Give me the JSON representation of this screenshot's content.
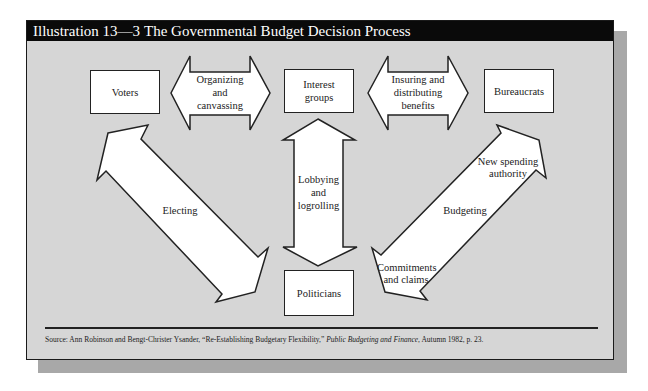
{
  "header": {
    "number": "Illustration 13—3",
    "title": "The Governmental Budget Decision Process"
  },
  "nodes": {
    "voters": "Voters",
    "interest_groups": "Interest groups",
    "bureaucrats": "Bureaucrats",
    "politicians": "Politicians"
  },
  "arrows": {
    "organizing": [
      "Organizing",
      "and",
      "canvassing"
    ],
    "insuring": [
      "Insuring and",
      "distributing",
      "benefits"
    ],
    "lobbying": [
      "Lobbying",
      "and",
      "logrolling"
    ],
    "electing": "Electing",
    "budgeting": "Budgeting",
    "new_spending": [
      "New spending",
      "authority"
    ],
    "commitments": [
      "Commitments",
      "and claims"
    ]
  },
  "source": {
    "prefix": "Source: Ann Robinson and Bengt-Christer Ysander, “Re-Establishing Budgetary Flexibility,” ",
    "journal": "Public Budgeting and Finance",
    "suffix": ", Autumn 1982, p. 23."
  },
  "colors": {
    "panel": "#d6d6d6",
    "header": "#0a0a0a",
    "shadow": "#a8a8a8"
  }
}
